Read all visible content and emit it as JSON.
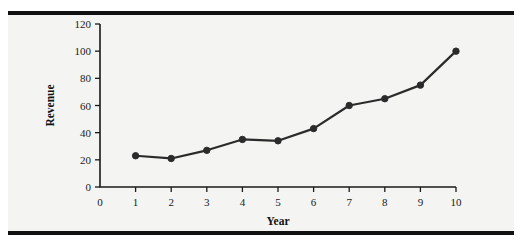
{
  "figure": {
    "background_color": "#f4f4f2",
    "page_color": "#ffffff",
    "rule_color": "#111111"
  },
  "chart_data": {
    "type": "line",
    "title": "",
    "xlabel": "Year",
    "ylabel": "Revenue",
    "x": [
      1,
      2,
      3,
      4,
      5,
      6,
      7,
      8,
      9,
      10
    ],
    "values": [
      23,
      21,
      27,
      35,
      34,
      43,
      60,
      65,
      75,
      100
    ],
    "series": [
      {
        "name": "Revenue",
        "values": [
          23,
          21,
          27,
          35,
          34,
          43,
          60,
          65,
          75,
          100
        ],
        "color": "#2b2b2b",
        "marker": "filled-circle"
      }
    ],
    "xlim": [
      0,
      10
    ],
    "ylim": [
      0,
      120
    ],
    "xticks": [
      0,
      1,
      2,
      3,
      4,
      5,
      6,
      7,
      8,
      9,
      10
    ],
    "xtick_labels": [
      "0",
      "1",
      "2",
      "3",
      "4",
      "5",
      "6",
      "7",
      "8",
      "9",
      "10"
    ],
    "yticks": [
      0,
      20,
      40,
      60,
      80,
      100,
      120
    ],
    "ytick_labels": [
      "0",
      "20",
      "40",
      "60",
      "80",
      "100",
      "120"
    ],
    "grid": false,
    "legend": false,
    "legend_position": "none"
  }
}
